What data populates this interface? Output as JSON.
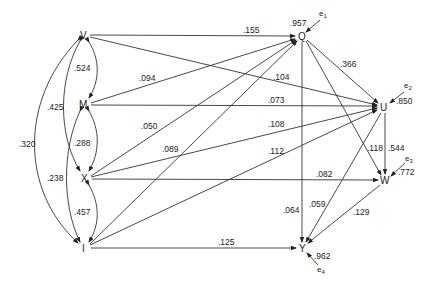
{
  "diagram": {
    "type": "path-diagram",
    "nodes": {
      "V": {
        "label": "V",
        "x": 84,
        "y": 35
      },
      "M": {
        "label": "M",
        "x": 84,
        "y": 104
      },
      "X": {
        "label": "X",
        "x": 85,
        "y": 178
      },
      "I": {
        "label": "I",
        "x": 84,
        "y": 248
      },
      "Q": {
        "label": "Q",
        "x": 302,
        "y": 36
      },
      "U": {
        "label": "U",
        "x": 384,
        "y": 107
      },
      "W": {
        "label": "W",
        "x": 385,
        "y": 180
      },
      "Y": {
        "label": "Y",
        "x": 303,
        "y": 248
      }
    },
    "errors": {
      "e1": {
        "label": "e",
        "sub": "1",
        "coef": ".957"
      },
      "e2": {
        "label": "e",
        "sub": "2",
        "coef": ".850"
      },
      "e3": {
        "label": "e",
        "sub": "3",
        "coef": ".772"
      },
      "e4": {
        "label": "e",
        "sub": "4",
        "coef": ".962"
      }
    },
    "correlations": [
      {
        "from": "V",
        "to": "M",
        "value": ".524"
      },
      {
        "from": "V",
        "to": "X",
        "value": ".425"
      },
      {
        "from": "V",
        "to": "I",
        "value": ".320"
      },
      {
        "from": "M",
        "to": "X",
        "value": ".288"
      },
      {
        "from": "M",
        "to": "I",
        "value": ".238"
      },
      {
        "from": "X",
        "to": "I",
        "value": ".457"
      }
    ],
    "paths": [
      {
        "from": "V",
        "to": "Q",
        "value": ".155"
      },
      {
        "from": "M",
        "to": "Q",
        "value": ".094"
      },
      {
        "from": "X",
        "to": "Q",
        "value": ".050"
      },
      {
        "from": "I",
        "to": "Q",
        "value": ".089"
      },
      {
        "from": "V",
        "to": "U",
        "value": ".104"
      },
      {
        "from": "M",
        "to": "U",
        "value": ".073"
      },
      {
        "from": "X",
        "to": "U",
        "value": ".108"
      },
      {
        "from": "I",
        "to": "U",
        "value": ".112"
      },
      {
        "from": "Q",
        "to": "U",
        "value": ".366"
      },
      {
        "from": "Q",
        "to": "W",
        "value": ".118"
      },
      {
        "from": "U",
        "to": "W",
        "value": ".544"
      },
      {
        "from": "X",
        "to": "W",
        "value": ".082"
      },
      {
        "from": "Q",
        "to": "Y",
        "value": ".064"
      },
      {
        "from": "U",
        "to": "Y",
        "value": ".059"
      },
      {
        "from": "W",
        "to": "Y",
        "value": ".129"
      },
      {
        "from": "I",
        "to": "Y",
        "value": ".125"
      }
    ]
  }
}
